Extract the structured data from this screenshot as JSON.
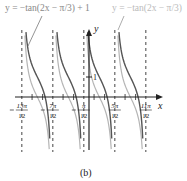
{
  "chart_data": {
    "type": "line",
    "title": "",
    "caption": "(b)",
    "xlabel": "x",
    "ylabel": "y",
    "grid": false,
    "legend_position": "top annotations",
    "series": [
      {
        "name": "y = −tan(2x − π/3) + 1",
        "color": "#555555",
        "function": "-tan(2x - pi/3) + 1"
      },
      {
        "name": "y = −tan(2x − π/3)",
        "color": "#b5b5b5",
        "function": "-tan(2x - pi/3)"
      }
    ],
    "asymptotes": [
      "−13π/12",
      "−7π/12",
      "−π/12",
      "5π/12",
      "11π/12"
    ],
    "x_ticks": [
      {
        "num": "13π",
        "den": "12",
        "neg": true
      },
      {
        "num": "7π",
        "den": "12",
        "neg": true
      },
      {
        "num": "π",
        "den": "12",
        "neg": true
      },
      {
        "num": "5π",
        "den": "12",
        "neg": false
      },
      {
        "num": "11π",
        "den": "12",
        "neg": false
      }
    ],
    "y_ticks": [
      "1"
    ],
    "period": "π/2"
  },
  "labels": {
    "series1": "y = −tan(2x − π/3) + 1",
    "series2": "y = −tan(2x − π/3)",
    "x_axis": "x",
    "y_axis": "y",
    "y_tick_1": "1",
    "caption": "(b)"
  }
}
